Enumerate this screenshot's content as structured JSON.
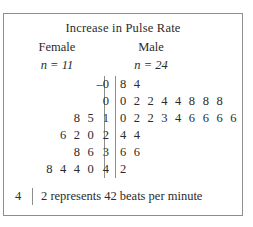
{
  "chart_data": {
    "type": "table",
    "title": "Increase in Pulse Rate",
    "plot_kind": "back-to-back stem-and-leaf plot",
    "left_group": {
      "label": "Female",
      "n_prefix": "n = ",
      "n_value": "11",
      "n_text": "n = 11"
    },
    "right_group": {
      "label": "Male",
      "n_prefix": "n = ",
      "n_value": "24",
      "n_text": "n = 24"
    },
    "rows": [
      {
        "stem": "–0",
        "left_leaves": "",
        "right_leaves": "8 4"
      },
      {
        "stem": "0",
        "left_leaves": "",
        "right_leaves": "0 2 2 4 4 8 8 8"
      },
      {
        "stem": "1",
        "left_leaves": "8 5",
        "right_leaves": "0 2 2 3 4 6 6 6 6"
      },
      {
        "stem": "2",
        "left_leaves": "6 2 0",
        "right_leaves": "4 4"
      },
      {
        "stem": "3",
        "left_leaves": "8 6",
        "right_leaves": "6 6"
      },
      {
        "stem": "4",
        "left_leaves": "8 4 4 0",
        "right_leaves": "2"
      }
    ],
    "key": {
      "stem": "4",
      "text": "2 represents 42 beats per minute",
      "leaf": "2",
      "value": "42",
      "units": "beats per minute"
    },
    "colors": {
      "text": "#2b2b2b",
      "rule": "#8d8d8d",
      "border": "#8d8d8d",
      "background": "#ffffff"
    }
  }
}
